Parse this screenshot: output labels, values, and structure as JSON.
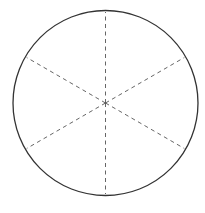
{
  "diagram": {
    "type": "circle-divided-into-sectors",
    "sectors": 6,
    "canvas": {
      "width": 205,
      "height": 213
    },
    "circle": {
      "cx": 105.5,
      "cy": 103,
      "r": 92.5,
      "stroke": "#333333",
      "stroke_width": 1.3,
      "fill": "#ffffff"
    },
    "spokes": {
      "count": 6,
      "angles_deg": [
        90,
        150,
        210,
        270,
        330,
        30
      ],
      "length": 91,
      "stroke": "#555555",
      "stroke_width": 0.9,
      "dash": "4 3.5"
    }
  }
}
